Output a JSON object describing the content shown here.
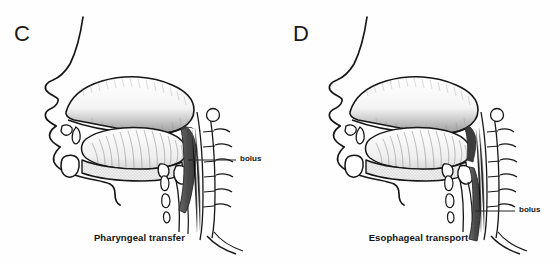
{
  "figure": {
    "type": "medical-illustration",
    "background_color": "#fefefe",
    "ink_color": "#151515",
    "bolus_fill_color": "#555555"
  },
  "panels": [
    {
      "letter": "C",
      "caption": "Pharyngeal transfer",
      "label": "bolus",
      "bolus_location": "pharynx",
      "label_x": 240,
      "label_y": 159
    },
    {
      "letter": "D",
      "caption": "Esophageal transport",
      "label": "bolus",
      "bolus_location": "esophagus",
      "label_x": 519,
      "label_y": 210
    }
  ]
}
